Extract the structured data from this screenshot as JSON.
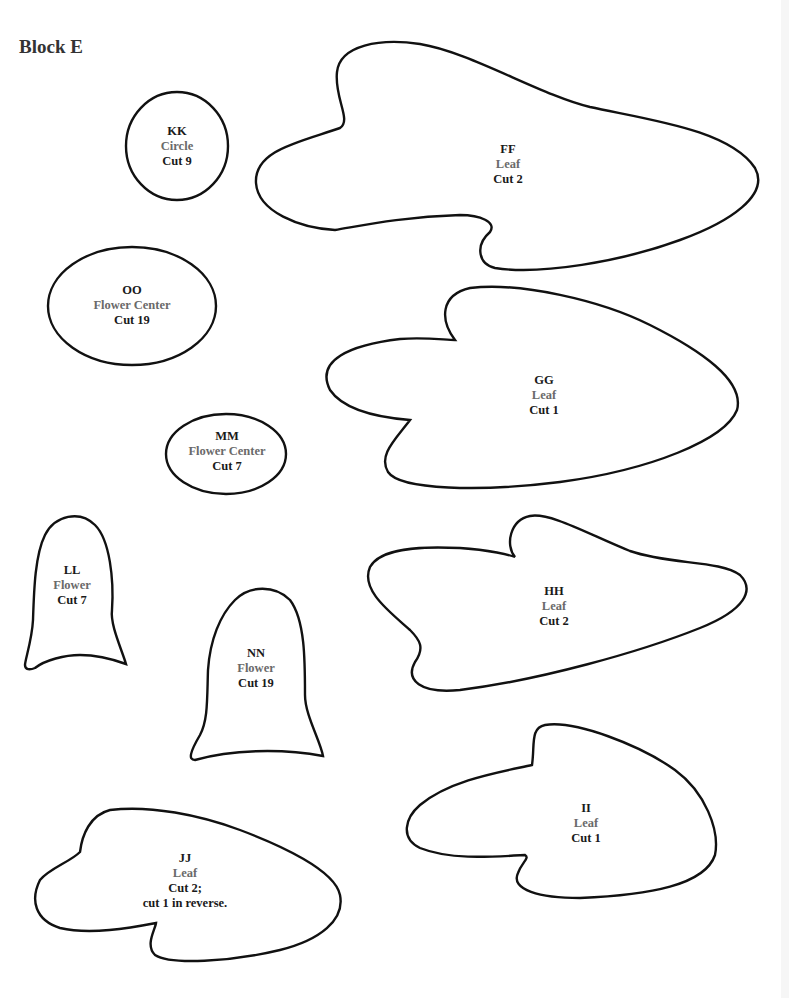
{
  "page": {
    "title": "Block E",
    "colors": {
      "outline": "#111111",
      "code_text": "#1a1a1a",
      "kind_text": "#6a6a6a",
      "title_text": "#333333"
    }
  },
  "pieces": {
    "kk": {
      "code": "KK",
      "kind": "Circle",
      "cut": "Cut 9"
    },
    "ff": {
      "code": "FF",
      "kind": "Leaf",
      "cut": "Cut 2"
    },
    "oo": {
      "code": "OO",
      "kind": "Flower Center",
      "cut": "Cut 19"
    },
    "gg": {
      "code": "GG",
      "kind": "Leaf",
      "cut": "Cut 1"
    },
    "mm": {
      "code": "MM",
      "kind": "Flower Center",
      "cut": "Cut 7"
    },
    "ll": {
      "code": "LL",
      "kind": "Flower",
      "cut": "Cut 7"
    },
    "hh": {
      "code": "HH",
      "kind": "Leaf",
      "cut": "Cut 2"
    },
    "nn": {
      "code": "NN",
      "kind": "Flower",
      "cut": "Cut 19"
    },
    "ii": {
      "code": "II",
      "kind": "Leaf",
      "cut": "Cut 1"
    },
    "jj": {
      "code": "JJ",
      "kind": "Leaf",
      "cut": "Cut 2;",
      "note": "cut 1 in reverse."
    }
  }
}
